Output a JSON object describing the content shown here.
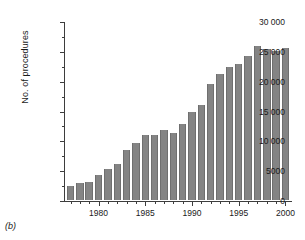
{
  "figure": {
    "panel_label": "(b)"
  },
  "chart_data": {
    "type": "bar",
    "title": "",
    "xlabel": "",
    "ylabel": "No. of procedures",
    "xlim": [
      1976.3,
      2000.7
    ],
    "ylim": [
      0,
      30000
    ],
    "grid": false,
    "legend": null,
    "bar_color": "#848484",
    "axis_color": "#3d3d3d",
    "categories": [
      1977,
      1978,
      1979,
      1980,
      1981,
      1982,
      1983,
      1984,
      1985,
      1986,
      1987,
      1988,
      1989,
      1990,
      1991,
      1992,
      1993,
      1994,
      1995,
      1996,
      1997,
      1998,
      1999,
      2000
    ],
    "values": [
      2400,
      2800,
      3050,
      4150,
      5250,
      6100,
      8450,
      9600,
      10850,
      10950,
      11750,
      11300,
      12800,
      14700,
      15850,
      19500,
      21200,
      22350,
      22800,
      24100,
      25850,
      25350,
      25000,
      25400
    ],
    "y_ticks": [
      0,
      5000,
      10000,
      15000,
      20000,
      25000,
      30000
    ],
    "y_tick_labels": [
      "0",
      "5000",
      "10 000",
      "15 000",
      "20 000",
      "25 000",
      "30 000"
    ],
    "y_minor_ticks": [
      2500,
      7500,
      12500,
      17500,
      22500,
      27500
    ],
    "x_ticks": [
      1980,
      1985,
      1990,
      1995,
      2000
    ],
    "x_tick_labels": [
      "1980",
      "1985",
      "1990",
      "1995",
      "2000"
    ],
    "x_minor_ticks": [
      1977,
      1978,
      1979,
      1981,
      1982,
      1983,
      1984,
      1986,
      1987,
      1988,
      1989,
      1991,
      1992,
      1993,
      1994,
      1996,
      1997,
      1998,
      1999
    ]
  }
}
